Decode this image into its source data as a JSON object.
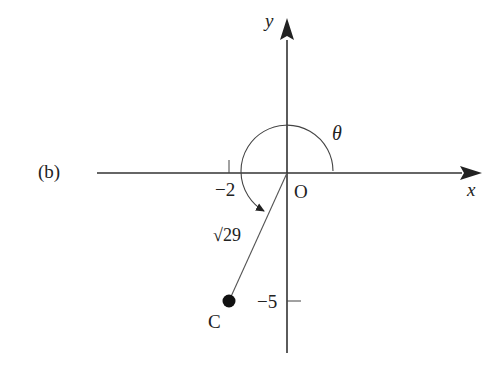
{
  "figure": {
    "part_label": "(b)",
    "axes": {
      "x_label": "x",
      "y_label": "y",
      "origin_label": "O"
    },
    "ticks": {
      "x_tick": "−2",
      "y_tick": "−5"
    },
    "angle_label": "θ",
    "length_label": "√29",
    "point_label": "C",
    "point": {
      "x": -2,
      "y": -5
    },
    "colors": {
      "stroke": "#333333",
      "point": "#111111",
      "background": "#ffffff"
    }
  }
}
